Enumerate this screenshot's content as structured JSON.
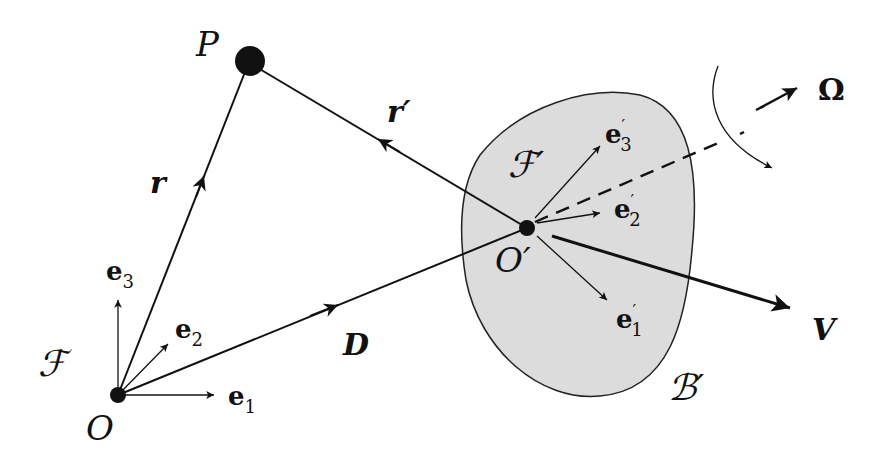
{
  "diagram": {
    "type": "rigid-body-kinematics",
    "colors": {
      "ink": "#111111",
      "body_fill": "#dcdcdc",
      "background": "#ffffff"
    },
    "points": {
      "O": {
        "label": "O",
        "x": 118,
        "y": 395
      },
      "P": {
        "label": "P",
        "x": 248,
        "y": 63
      },
      "O_prime": {
        "label": "O′",
        "x": 527,
        "y": 228
      }
    },
    "frames": {
      "F": {
        "label": "ℱ",
        "axes": [
          "e₁",
          "e₂",
          "e₃"
        ]
      },
      "F_prime": {
        "label": "ℱ′",
        "axes": [
          "e′₁",
          "e′₂",
          "e′₃"
        ]
      }
    },
    "vectors": {
      "r": {
        "label": "r",
        "from": "O",
        "to": "P"
      },
      "r_prime": {
        "label": "r′",
        "from": "O_prime",
        "to": "P"
      },
      "D": {
        "label": "D",
        "from": "O",
        "to": "O_prime"
      },
      "V": {
        "label": "V",
        "from": "O_prime",
        "direction": "translational velocity"
      },
      "Omega": {
        "label": "Ω",
        "from": "O_prime",
        "direction": "angular velocity",
        "style": "dashed"
      }
    },
    "body": {
      "label": "ℬ′"
    },
    "labels": {
      "P": "P",
      "O": "O",
      "O_prime_base": "O",
      "prime": "′",
      "r": "r",
      "r_prime": "r",
      "D": "D",
      "V": "V",
      "Omega": "Ω",
      "F": "ℱ",
      "F_prime": "ℱ",
      "B_prime": "ℬ",
      "e": "e",
      "sub1": "1",
      "sub2": "2",
      "sub3": "3"
    }
  }
}
